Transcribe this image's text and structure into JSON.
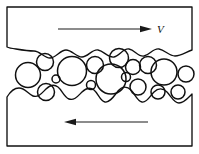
{
  "figure": {
    "type": "schematic-diagram",
    "width": 199,
    "height": 154,
    "background_color": "#ffffff",
    "line_color": "#101010"
  },
  "upper_body": {
    "name": "upper-counterface",
    "fill_color": "#ffffff",
    "stroke_color": "#101010",
    "frame": {
      "left_x": 7,
      "right_x": 192,
      "top_y": 7
    },
    "rough_surface_mean_y": 52,
    "surface_path": "M 7 7 L 192 7 L 192 50 C 186 52 181 56 175 56 C 169 56 165 50 159 49 C 153 48 150 55 144 56 C 138 57 135 50 129 49 C 123 48 120 56 114 57 C 108 58 104 51 98 50 C 92 49 88 57 82 57 C 76 57 72 50 66 50 C 60 50 56 58 50 58 C 44 58 40 51 34 51 C 28 51 22 50 16 49 C 12 48.5 9 48 7 47 Z"
  },
  "lower_body": {
    "name": "lower-counterface",
    "fill_color": "#ffffff",
    "stroke_color": "#101010",
    "frame": {
      "left_x": 7,
      "right_x": 192,
      "bottom_y": 146
    },
    "rough_surface_mean_y": 96,
    "surface_path": "M 7 146 L 7 97 C 10 92 14 88 19 88 C 25 88 28 94 33 96 C 38 98 42 93 46 89 C 50 85 54 84 58 87 C 62 90 64 97 69 99 C 74 101 78 96 82 92 C 86 88 90 87 94 90 C 98 93 100 101 105 102 C 110 103 114 96 118 91 C 122 86 127 86 131 90 C 135 94 137 101 142 102 C 147 103 150 96 154 92 C 158 88 163 88 167 92 C 171 96 174 103 179 103 C 184 103 188 98 192 94 L 192 146 Z"
  },
  "particles": {
    "name": "wear-particles",
    "count": 17,
    "stroke_color": "#101010",
    "items": [
      {
        "id": "p1",
        "cx": 28,
        "cy": 75,
        "r": 12.5
      },
      {
        "id": "p2",
        "cx": 45,
        "cy": 62,
        "r": 8.5
      },
      {
        "id": "p3",
        "cx": 46,
        "cy": 92,
        "r": 8.5
      },
      {
        "id": "p4",
        "cx": 72,
        "cy": 71,
        "r": 14.5
      },
      {
        "id": "p5",
        "cx": 95,
        "cy": 65,
        "r": 8.5
      },
      {
        "id": "p6",
        "cx": 111,
        "cy": 79,
        "r": 15.0
      },
      {
        "id": "p7",
        "cx": 119,
        "cy": 58,
        "r": 9.5
      },
      {
        "id": "p8",
        "cx": 133,
        "cy": 67,
        "r": 7.5
      },
      {
        "id": "p9",
        "cx": 138,
        "cy": 87,
        "r": 8.0
      },
      {
        "id": "p10",
        "cx": 148,
        "cy": 65,
        "r": 8.5
      },
      {
        "id": "p11",
        "cx": 164,
        "cy": 72,
        "r": 13.0
      },
      {
        "id": "p12",
        "cx": 158,
        "cy": 92,
        "r": 7.0
      },
      {
        "id": "p13",
        "cx": 178,
        "cy": 92,
        "r": 7.0
      },
      {
        "id": "p14",
        "cx": 186,
        "cy": 74,
        "r": 8.0
      },
      {
        "id": "p15",
        "cx": 56,
        "cy": 79,
        "r": 4.0
      },
      {
        "id": "p16",
        "cx": 91,
        "cy": 85,
        "r": 4.5
      },
      {
        "id": "p17",
        "cx": 126,
        "cy": 77,
        "r": 4.5
      }
    ]
  },
  "upper_motion": {
    "name": "upper-velocity-arrow",
    "direction": "right",
    "label": "V",
    "label_x": 157,
    "label_y": 33,
    "line": {
      "x1": 58,
      "y1": 29,
      "x2": 146,
      "y2": 29
    },
    "head": {
      "tip_x": 152,
      "tip_y": 29,
      "back_x": 140,
      "half_height": 3.2
    },
    "color": "#1a1a1a"
  },
  "lower_motion": {
    "name": "lower-velocity-arrow",
    "direction": "left",
    "label": "",
    "line": {
      "x1": 70,
      "y1": 122,
      "x2": 148,
      "y2": 122
    },
    "head": {
      "tip_x": 64,
      "tip_y": 122,
      "back_x": 76,
      "half_height": 3.2
    },
    "color": "#1a1a1a"
  }
}
